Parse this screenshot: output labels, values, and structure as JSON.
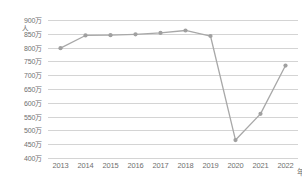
{
  "chart_data": {
    "type": "line",
    "title": "",
    "xlabel": "年",
    "ylabel": "人",
    "x": [
      "2013",
      "2014",
      "2015",
      "2016",
      "2017",
      "2018",
      "2019",
      "2020",
      "2021",
      "2022"
    ],
    "categories": [
      "2013",
      "2014",
      "2015",
      "2016",
      "2017",
      "2018",
      "2019",
      "2020",
      "2021",
      "2022"
    ],
    "values": [
      7980000,
      8440000,
      8450000,
      8480000,
      8530000,
      8620000,
      8420000,
      4650000,
      5600000,
      7350000
    ],
    "series": [
      {
        "name": "人数",
        "values": [
          7980000,
          8440000,
          8450000,
          8480000,
          8530000,
          8620000,
          8420000,
          4650000,
          5600000,
          7350000
        ]
      }
    ],
    "ylim": [
      4000000,
      9000000
    ],
    "ytick_values": [
      9000000,
      8500000,
      8000000,
      7500000,
      7000000,
      6500000,
      6000000,
      5500000,
      5000000,
      4500000,
      4000000
    ],
    "ytick_labels": [
      "900万",
      "850万",
      "800万",
      "750万",
      "700万",
      "650万",
      "600万",
      "550万",
      "500万",
      "450万",
      "400万"
    ],
    "xtick_labels": [
      "2013",
      "2014",
      "2015",
      "2016",
      "2017",
      "2018",
      "2019",
      "2020",
      "2021",
      "2022"
    ],
    "unit_y": "人",
    "unit_x": "年",
    "grid": true,
    "legend": false,
    "legend_position": "none",
    "line_color": "#a8a8a8",
    "marker_color": "#a0a0a0",
    "grid_color": "#d4d4d4",
    "background_color": "#ffffff",
    "text_color": "#6f6f6f"
  }
}
